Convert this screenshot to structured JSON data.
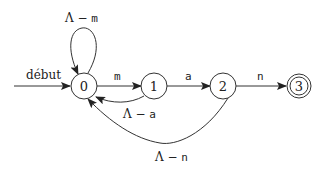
{
  "diagram": {
    "type": "finite-automaton",
    "start_label": "début",
    "states": [
      {
        "id": "0",
        "label": "0",
        "accepting": false,
        "initial": true
      },
      {
        "id": "1",
        "label": "1",
        "accepting": false,
        "initial": false
      },
      {
        "id": "2",
        "label": "2",
        "accepting": false,
        "initial": false
      },
      {
        "id": "3",
        "label": "3",
        "accepting": true,
        "initial": false
      }
    ],
    "transitions": [
      {
        "from": "0",
        "to": "0",
        "label_prefix": "Λ − ",
        "label_symbol": "m"
      },
      {
        "from": "0",
        "to": "1",
        "label_prefix": "",
        "label_symbol": "m"
      },
      {
        "from": "1",
        "to": "2",
        "label_prefix": "",
        "label_symbol": "a"
      },
      {
        "from": "2",
        "to": "3",
        "label_prefix": "",
        "label_symbol": "n"
      },
      {
        "from": "1",
        "to": "0",
        "label_prefix": "Λ − ",
        "label_symbol": "a"
      },
      {
        "from": "2",
        "to": "0",
        "label_prefix": "Λ − ",
        "label_symbol": "n"
      }
    ]
  }
}
